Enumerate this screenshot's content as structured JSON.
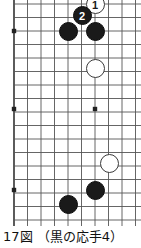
{
  "figure": {
    "caption": "17図 （黒の応手4）",
    "caption_label": "17図",
    "caption_note": "（黒の応手4）"
  },
  "board": {
    "type": "go-board-corner",
    "line_color": "#555555",
    "edge_color": "#333333",
    "background": "#ffffff",
    "grid_spacing": 13.5,
    "origin_x": 14,
    "origin_y": 4,
    "columns": 10,
    "rows": 17,
    "star_points": [
      {
        "x": 14,
        "y": 31
      },
      {
        "x": 14,
        "y": 109
      },
      {
        "x": 95,
        "y": 109
      },
      {
        "x": 14,
        "y": 190
      }
    ]
  },
  "stones": [
    {
      "color": "white",
      "label": "1",
      "x": 95,
      "y": 4,
      "name": "white-stone-move-1"
    },
    {
      "color": "black",
      "label": "2",
      "x": 82,
      "y": 15,
      "name": "black-stone-move-2"
    },
    {
      "color": "black",
      "label": "",
      "x": 68,
      "y": 31,
      "name": "black-stone-a"
    },
    {
      "color": "black",
      "label": "",
      "x": 95,
      "y": 31,
      "name": "black-stone-b"
    },
    {
      "color": "white",
      "label": "",
      "x": 95,
      "y": 68,
      "name": "white-stone-a"
    },
    {
      "color": "white",
      "label": "",
      "x": 109,
      "y": 163,
      "name": "white-stone-b"
    },
    {
      "color": "black",
      "label": "",
      "x": 95,
      "y": 190,
      "name": "black-stone-c"
    },
    {
      "color": "black",
      "label": "",
      "x": 68,
      "y": 204,
      "name": "black-stone-d"
    }
  ]
}
